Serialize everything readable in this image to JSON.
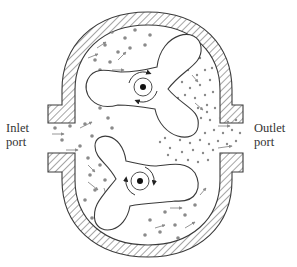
{
  "diagram": {
    "type": "rotary lobe pump cross-section",
    "labels": {
      "inlet": [
        "Inlet",
        "port"
      ],
      "outlet": [
        "Outlet",
        "port"
      ]
    },
    "rotors": [
      {
        "name": "upper-rotor",
        "lobes": 3,
        "rotation": "clockwise"
      },
      {
        "name": "lower-rotor",
        "lobes": 3,
        "rotation": "counterclockwise"
      }
    ],
    "regions": {
      "inlet_side": "sparse fluid particles",
      "outlet_side": "dense fluid particles"
    },
    "colors": {
      "line": "#3a3a3a",
      "hatch": "#5a5a5a",
      "particle": "#8a8a8a",
      "arrow": "#8a8a8a",
      "background": "#ffffff"
    }
  }
}
